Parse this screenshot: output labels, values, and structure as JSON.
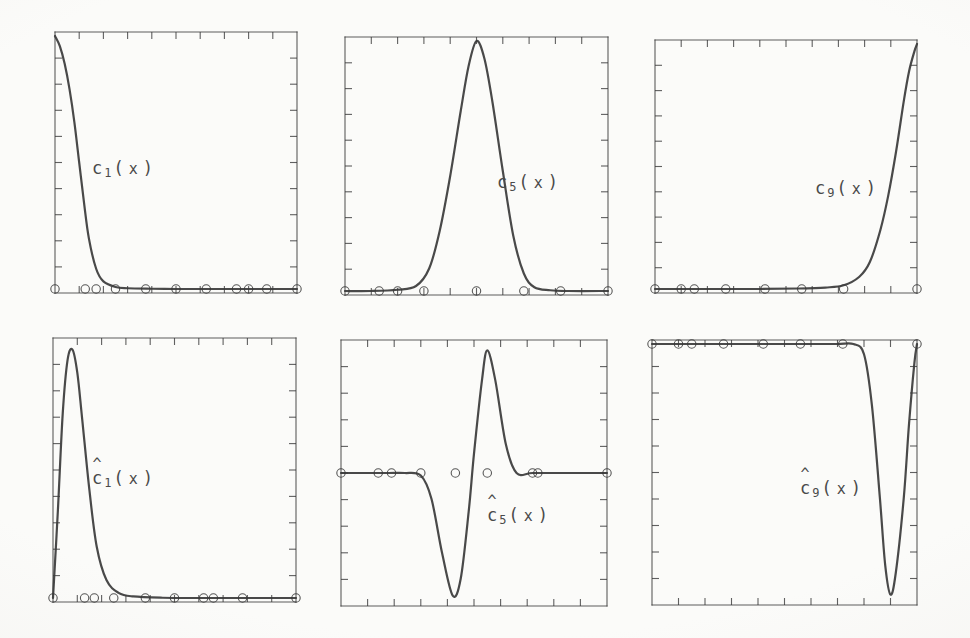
{
  "figure": {
    "background_color": "#fbfbf9",
    "ink_color": "#3a3a3a",
    "label_color": "#4a4a4a",
    "rows": 2,
    "columns": 3
  },
  "axes": {
    "frame_stroke_width": 1.1,
    "tick_count_x": 9,
    "tick_count_y": 9,
    "tick_direction": "inward",
    "tick_length": 7,
    "grid": false,
    "tick_labels_x": [],
    "tick_labels_y": []
  },
  "markers": {
    "shape": "open-circle",
    "radius": 4.2,
    "stroke_width": 1.1,
    "fill": "none"
  },
  "panels": [
    {
      "id": "c1",
      "label_parts": {
        "hat": "",
        "base": "c",
        "sub": "1",
        "open": "(",
        "arg": "x",
        "close": ")"
      },
      "label_text": "c_1(x)",
      "label_x": 92,
      "label_y": 158,
      "rect": {
        "x": 55,
        "y": 32,
        "w": 242,
        "h": 261
      }
    },
    {
      "id": "c5",
      "label_parts": {
        "hat": "",
        "base": "c",
        "sub": "5",
        "open": "(",
        "arg": "x",
        "close": ")"
      },
      "label_text": "c_5(x)",
      "label_x": 497,
      "label_y": 172,
      "rect": {
        "x": 345,
        "y": 37,
        "w": 263,
        "h": 258
      }
    },
    {
      "id": "c9",
      "label_parts": {
        "hat": "",
        "base": "c",
        "sub": "9",
        "open": "(",
        "arg": "x",
        "close": ")"
      },
      "label_text": "c_9(x)",
      "label_x": 815,
      "label_y": 178,
      "rect": {
        "x": 655,
        "y": 40,
        "w": 262,
        "h": 253
      }
    },
    {
      "id": "c1hat",
      "label_parts": {
        "hat": "^",
        "base": "c",
        "sub": "1",
        "open": "(",
        "arg": "x",
        "close": ")"
      },
      "label_text": "chat_1(x)",
      "label_x": 92,
      "label_y": 468,
      "rect": {
        "x": 53,
        "y": 338,
        "w": 243,
        "h": 264
      }
    },
    {
      "id": "c5hat",
      "label_parts": {
        "hat": "^",
        "base": "c",
        "sub": "5",
        "open": "(",
        "arg": "x",
        "close": ")"
      },
      "label_text": "chat_5(x)",
      "label_x": 487,
      "label_y": 505,
      "rect": {
        "x": 341,
        "y": 340,
        "w": 266,
        "h": 266
      }
    },
    {
      "id": "c9hat",
      "label_parts": {
        "hat": "^",
        "base": "c",
        "sub": "9",
        "open": "(",
        "arg": "x",
        "close": ")"
      },
      "label_text": "chat_9(x)",
      "label_x": 800,
      "label_y": 478,
      "rect": {
        "x": 652,
        "y": 340,
        "w": 265,
        "h": 265
      }
    }
  ],
  "chart_data": [
    {
      "id": "c1",
      "type": "line",
      "title": "c_1(x)",
      "xlabel": "x",
      "ylabel": "",
      "xlim": [
        0,
        1
      ],
      "ylim": [
        0,
        1
      ],
      "grid": false,
      "description": "Monotone decreasing basis function: starts at maximum on the left boundary and decays rapidly to zero, remaining flat at zero across the rest of the domain.",
      "series": [
        {
          "name": "c_1",
          "x": [
            0.0,
            0.02,
            0.04,
            0.06,
            0.08,
            0.1,
            0.12,
            0.14,
            0.17,
            0.2,
            0.25,
            0.3,
            0.4,
            0.5,
            0.6,
            0.7,
            0.8,
            0.9,
            1.0
          ],
          "y": [
            1.0,
            0.96,
            0.89,
            0.79,
            0.66,
            0.5,
            0.34,
            0.2,
            0.08,
            0.03,
            0.008,
            0.003,
            0.001,
            0.0,
            0.0,
            0.0,
            0.0,
            0.0,
            0.0
          ]
        }
      ],
      "markers_x": [
        0.0,
        0.125,
        0.17,
        0.25,
        0.375,
        0.5,
        0.625,
        0.75,
        0.8,
        0.875,
        1.0
      ],
      "markers_y": [
        0.0,
        0.0,
        0.0,
        0.0,
        0.0,
        0.0,
        0.0,
        0.0,
        0.0,
        0.0,
        0.0
      ]
    },
    {
      "id": "c5",
      "type": "line",
      "title": "c_5(x)",
      "xlabel": "x",
      "ylabel": "",
      "xlim": [
        0,
        1
      ],
      "ylim": [
        0,
        1
      ],
      "grid": false,
      "description": "Symmetric interior bump centred near x = 0.5, rising from zero to a peak of 1 and falling back to zero; compactly supported over roughly 0.3 to 0.72.",
      "series": [
        {
          "name": "c_5",
          "x": [
            0.0,
            0.1,
            0.2,
            0.27,
            0.32,
            0.36,
            0.4,
            0.44,
            0.47,
            0.5,
            0.53,
            0.56,
            0.6,
            0.64,
            0.68,
            0.72,
            0.78,
            0.85,
            1.0
          ],
          "y": [
            0.0,
            0.0,
            0.005,
            0.02,
            0.09,
            0.24,
            0.46,
            0.72,
            0.9,
            1.0,
            0.93,
            0.76,
            0.48,
            0.22,
            0.07,
            0.015,
            0.003,
            0.0,
            0.0
          ]
        }
      ],
      "markers_x": [
        0.0,
        0.13,
        0.2,
        0.3,
        0.5,
        0.68,
        0.82,
        1.0
      ],
      "markers_y": [
        0.0,
        0.0,
        0.0,
        0.0,
        0.0,
        0.0,
        0.0,
        0.0
      ]
    },
    {
      "id": "c9",
      "type": "line",
      "title": "c_9(x)",
      "xlabel": "x",
      "ylabel": "",
      "xlim": [
        0,
        1
      ],
      "ylim": [
        0,
        1
      ],
      "grid": false,
      "description": "Mirror image of c_1: flat at zero across most of the domain, then rising steeply near the right boundary to reach the maximum of 1 at x = 1.",
      "series": [
        {
          "name": "c_9",
          "x": [
            0.0,
            0.2,
            0.4,
            0.55,
            0.65,
            0.72,
            0.78,
            0.82,
            0.86,
            0.89,
            0.92,
            0.95,
            0.97,
            0.99,
            1.0
          ],
          "y": [
            0.0,
            0.0,
            0.0,
            0.002,
            0.006,
            0.015,
            0.05,
            0.11,
            0.24,
            0.38,
            0.56,
            0.77,
            0.89,
            0.97,
            1.0
          ]
        }
      ],
      "markers_x": [
        0.0,
        0.1,
        0.15,
        0.27,
        0.42,
        0.56,
        0.72,
        1.0
      ],
      "markers_y": [
        0.0,
        0.0,
        0.0,
        0.0,
        0.0,
        0.0,
        0.0,
        0.0
      ]
    },
    {
      "id": "c1hat",
      "type": "line",
      "title": "chat_1(x)",
      "xlabel": "x",
      "ylabel": "",
      "xlim": [
        0,
        1
      ],
      "ylim": [
        0,
        1
      ],
      "grid": false,
      "description": "Dual basis function: narrow asymmetric spike rising from zero at the left boundary to a peak near x = 0.08, then decaying quickly to zero and staying flat.",
      "series": [
        {
          "name": "chat_1",
          "x": [
            0.0,
            0.02,
            0.04,
            0.06,
            0.08,
            0.1,
            0.12,
            0.15,
            0.18,
            0.22,
            0.27,
            0.33,
            0.45,
            0.6,
            0.8,
            1.0
          ],
          "y": [
            0.0,
            0.34,
            0.72,
            0.93,
            0.97,
            0.88,
            0.7,
            0.42,
            0.2,
            0.07,
            0.02,
            0.006,
            0.001,
            0.0,
            0.0,
            0.0
          ]
        }
      ],
      "markers_x": [
        0.0,
        0.13,
        0.17,
        0.25,
        0.38,
        0.5,
        0.62,
        0.66,
        0.78,
        1.0
      ],
      "markers_y": [
        0.0,
        0.0,
        0.0,
        0.0,
        0.0,
        0.0,
        0.0,
        0.0,
        0.0,
        0.0
      ]
    },
    {
      "id": "c5hat",
      "type": "line",
      "title": "chat_5(x)",
      "xlabel": "x",
      "ylabel": "",
      "xlim": [
        0,
        1
      ],
      "ylim": [
        -1,
        1
      ],
      "grid": false,
      "description": "Oscillatory dual function with a flat zero baseline at mid-height: dips to a deep negative trough near x = 0.42, then swings up to a tall positive peak near x = 0.55 before returning to the flat baseline.",
      "series": [
        {
          "name": "chat_5",
          "x": [
            0.0,
            0.1,
            0.18,
            0.24,
            0.3,
            0.34,
            0.38,
            0.42,
            0.45,
            0.48,
            0.5,
            0.53,
            0.55,
            0.58,
            0.62,
            0.66,
            0.72,
            0.82,
            0.9,
            1.0
          ],
          "y": [
            0.0,
            0.0,
            0.0,
            0.0,
            -0.02,
            -0.2,
            -0.62,
            -0.95,
            -0.82,
            -0.3,
            0.15,
            0.72,
            0.95,
            0.72,
            0.22,
            0.0,
            0.0,
            0.0,
            0.0,
            0.0
          ]
        }
      ],
      "markers_x": [
        0.0,
        0.14,
        0.19,
        0.3,
        0.43,
        0.55,
        0.72,
        0.74,
        1.0
      ],
      "markers_y": [
        0.0,
        0.0,
        0.0,
        0.0,
        0.0,
        0.0,
        0.0,
        0.0,
        0.0
      ]
    },
    {
      "id": "c9hat",
      "type": "line",
      "title": "chat_9(x)",
      "xlabel": "x",
      "ylabel": "",
      "xlim": [
        0,
        1
      ],
      "ylim": [
        -1,
        1
      ],
      "grid": false,
      "description": "Dual function flat at the top value across most of the domain, then plunging to a deep narrow trough near x = 0.88 and rising sharply back toward the top at the right boundary.",
      "series": [
        {
          "name": "chat_9",
          "x": [
            0.0,
            0.2,
            0.4,
            0.6,
            0.7,
            0.76,
            0.8,
            0.83,
            0.86,
            0.88,
            0.9,
            0.92,
            0.95,
            0.97,
            0.99,
            1.0
          ],
          "y": [
            1.0,
            1.0,
            1.0,
            1.0,
            1.0,
            1.0,
            0.92,
            0.52,
            -0.2,
            -0.72,
            -0.95,
            -0.78,
            -0.2,
            0.38,
            0.85,
            1.0
          ]
        }
      ],
      "markers_x": [
        0.0,
        0.1,
        0.15,
        0.27,
        0.42,
        0.56,
        0.72,
        1.0
      ],
      "markers_y": [
        1.0,
        1.0,
        1.0,
        1.0,
        1.0,
        1.0,
        1.0,
        1.0
      ]
    }
  ]
}
